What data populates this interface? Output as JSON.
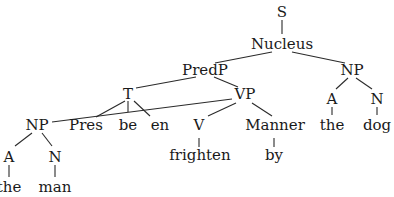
{
  "diagram": {
    "type": "syntax-tree",
    "nodes": {
      "s": "S",
      "nucleus": "Nucleus",
      "predp": "PredP",
      "np_right": "NP",
      "t": "T",
      "vp": "VP",
      "a_right": "A",
      "n_right": "N",
      "np_left": "NP",
      "pres": "Pres",
      "be": "be",
      "en": "en",
      "v": "V",
      "manner": "Manner",
      "the_right": "the",
      "dog": "dog",
      "a_left": "A",
      "n_left": "N",
      "frighten": "frighten",
      "by": "by",
      "the_left": "the",
      "man": "man"
    },
    "edges": [
      [
        "S",
        "Nucleus"
      ],
      [
        "Nucleus",
        "PredP"
      ],
      [
        "Nucleus",
        "NP(right)"
      ],
      [
        "PredP",
        "T"
      ],
      [
        "PredP",
        "VP"
      ],
      [
        "NP(right)",
        "A(right)"
      ],
      [
        "NP(right)",
        "N(right)"
      ],
      [
        "A(right)",
        "the"
      ],
      [
        "N(right)",
        "dog"
      ],
      [
        "T",
        "Pres"
      ],
      [
        "T",
        "be"
      ],
      [
        "T",
        "en"
      ],
      [
        "VP",
        "NP(left)"
      ],
      [
        "VP",
        "V"
      ],
      [
        "VP",
        "Manner"
      ],
      [
        "V",
        "frighten"
      ],
      [
        "Manner",
        "by"
      ],
      [
        "NP(left)",
        "A(left)"
      ],
      [
        "NP(left)",
        "N(left)"
      ],
      [
        "A(left)",
        "the"
      ],
      [
        "N(left)",
        "man"
      ]
    ]
  }
}
